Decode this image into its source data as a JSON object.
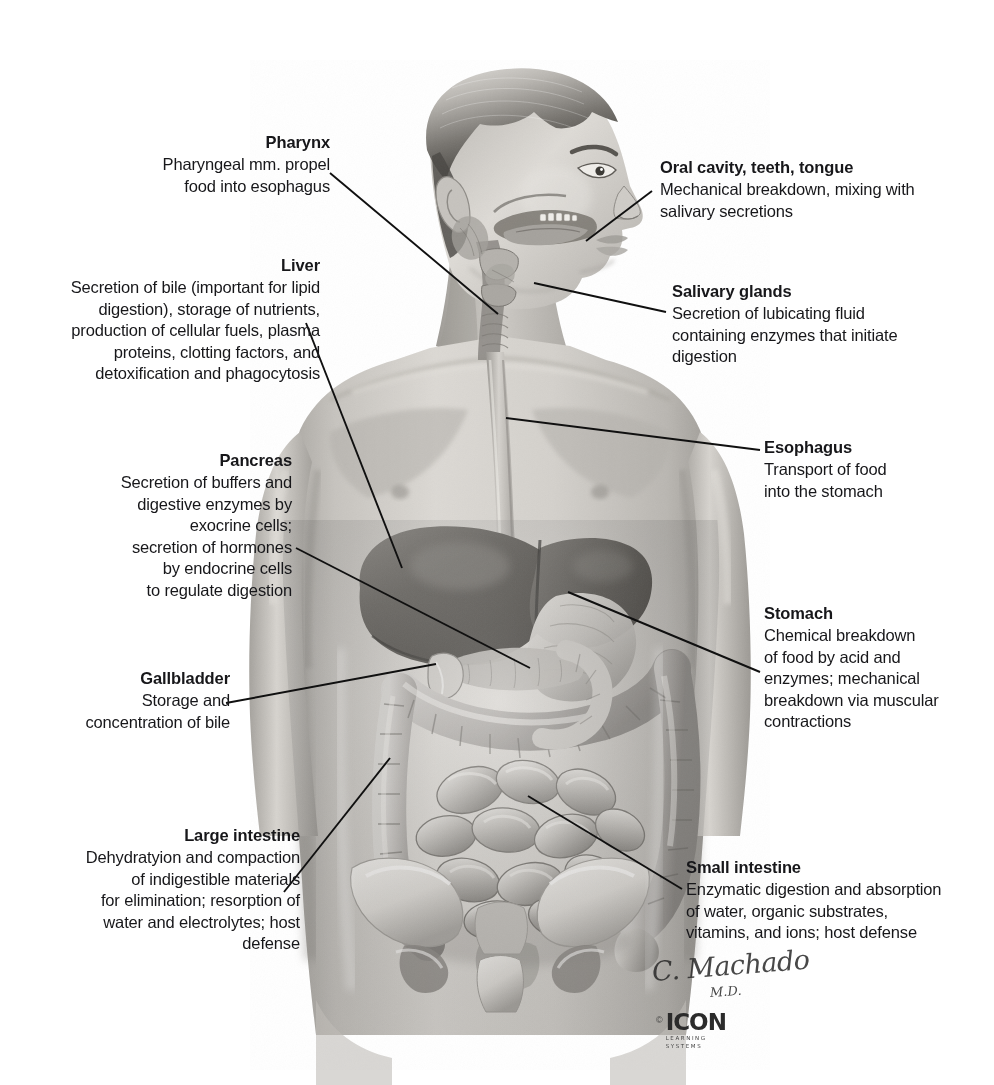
{
  "figure": {
    "illustration_alt": "Grayscale medical illustration: head in profile with oral cavity and pharynx, esophagus, liver, stomach, pancreas, gallbladder, small intestine, large intestine and pelvis"
  },
  "callouts": {
    "pharynx": {
      "title": "Pharynx",
      "body": "Pharyngeal mm. propel\nfood into esophagus",
      "side": "left"
    },
    "liver": {
      "title": "Liver",
      "body": "Secretion of bile (important for lipid\ndigestion), storage of nutrients,\nproduction of cellular fuels, plasma\nproteins, clotting factors, and\ndetoxification and phagocytosis",
      "side": "left"
    },
    "pancreas": {
      "title": "Pancreas",
      "body": "Secretion of buffers and\ndigestive enzymes by\nexocrine cells;\nsecretion of hormones\nby endocrine cells\nto regulate digestion",
      "side": "left"
    },
    "gallbladder": {
      "title": "Gallbladder",
      "body": "Storage and\nconcentration of bile",
      "side": "left"
    },
    "large_intestine": {
      "title": "Large intestine",
      "body": "Dehydratyion and compaction\nof indigestible materials\nfor elimination;  resorption of\nwater and electrolytes; host\ndefense",
      "side": "left"
    },
    "oral_cavity": {
      "title": "Oral cavity, teeth, tongue",
      "body": "Mechanical breakdown, mixing with\nsalivary secretions",
      "side": "right"
    },
    "salivary_glands": {
      "title": "Salivary glands",
      "body": "Secretion of lubicating fluid\ncontaining enzymes that initiate\ndigestion",
      "side": "right"
    },
    "esophagus": {
      "title": "Esophagus",
      "body": "Transport of food\ninto the stomach",
      "side": "right"
    },
    "stomach": {
      "title": "Stomach",
      "body": "Chemical breakdown\nof food by acid and\nenzymes; mechanical\nbreakdown via muscular\ncontractions",
      "side": "right"
    },
    "small_intestine": {
      "title": "Small intestine",
      "body": "Enzymatic digestion and absorption\nof water, organic substrates,\nvitamins, and ions; host defense",
      "side": "right"
    }
  },
  "credit": {
    "signature_name": "C. Machado",
    "signature_degree": "M.D.",
    "copyright_symbol": "©",
    "brand": "ICON",
    "tagline": "LEARNING\nSYSTEMS"
  },
  "colors": {
    "background": "#ffffff",
    "text": "#17171a",
    "leader_line": "#101010",
    "skin_light": "#d8d6d2",
    "skin_mid": "#b5b2ad",
    "skin_shadow": "#8e8b86",
    "organ_dark": "#5a5752",
    "organ_mid": "#9a9792",
    "organ_light": "#cfccc7",
    "bone": "#e8e6e1"
  }
}
